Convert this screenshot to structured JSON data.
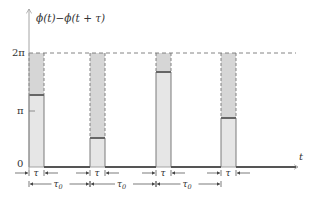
{
  "title": "",
  "y_axis": {
    "label": "ϕ(t)−ϕ(t + τ)",
    "ticks": [
      {
        "label": "2π",
        "value": 6.2832,
        "y": 53
      },
      {
        "label": "π",
        "value": 3.1416,
        "y": 111
      },
      {
        "label": "0",
        "value": 0,
        "y": 167
      }
    ]
  },
  "x_axis": {
    "label": "t"
  },
  "pulse_width_label": "τ",
  "period_label": "τ0",
  "period_label_main": "τ",
  "period_label_sub": "0",
  "colors": {
    "axis": "#9a9a9a",
    "baseline": "#555555",
    "pulse_fill": "#e6e6e6",
    "pulse_upper_fill": "#d6d6d6",
    "pulse_level": "#666666",
    "dashed": "#777777",
    "text": "#333333"
  },
  "pulses": [
    {
      "x": 29,
      "width": 15,
      "level_y": 95,
      "value_fraction_of_2pi": 0.63
    },
    {
      "x": 90,
      "width": 15,
      "level_y": 138,
      "value_fraction_of_2pi": 0.25
    },
    {
      "x": 156,
      "width": 15,
      "level_y": 72,
      "value_fraction_of_2pi": 0.83
    },
    {
      "x": 221,
      "width": 15,
      "level_y": 118,
      "value_fraction_of_2pi": 0.43
    }
  ],
  "chart_data": {
    "type": "diagram",
    "title": "",
    "ylabel": "ϕ(t)−ϕ(t + τ)",
    "xlabel": "t",
    "ytick_labels": [
      "0",
      "π",
      "2π"
    ],
    "ylim": [
      0,
      6.2832
    ],
    "pulse_width": "τ",
    "period": "τ0",
    "pulse_values_fraction_of_2pi": [
      0.63,
      0.25,
      0.83,
      0.43
    ],
    "annotations": [
      "τ",
      "τ",
      "τ",
      "τ",
      "τ0",
      "τ0",
      "τ0"
    ],
    "dashed_reference_line": "2π"
  }
}
